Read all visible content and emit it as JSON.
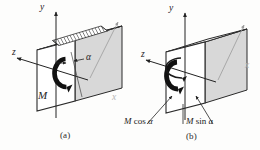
{
  "figure": {
    "background_color": "#fdfdfc",
    "ink_color": "#232323",
    "face_fill": "#d8d8d8",
    "top_face_fill": "#fbfbfb",
    "front_face_fill": "#ffffff"
  },
  "panels": [
    {
      "id": "a",
      "caption": "(a)",
      "axes": [
        {
          "name": "y",
          "label": "y"
        },
        {
          "name": "z",
          "label": "z"
        },
        {
          "name": "x",
          "label": "x"
        }
      ],
      "labels": {
        "moment": "M",
        "angle": "α"
      },
      "annotations": [
        {
          "name": "hatched-band",
          "label": ""
        },
        {
          "name": "moment-arc",
          "label": "M"
        },
        {
          "name": "angle-dimension",
          "label": "α"
        }
      ]
    },
    {
      "id": "b",
      "caption": "(b)",
      "axes": [
        {
          "name": "y",
          "label": "y"
        },
        {
          "name": "z",
          "label": "z"
        },
        {
          "name": "x",
          "label": "x"
        }
      ],
      "labels": {
        "moment_cos": {
          "sym": "M",
          "fn": "cos",
          "arg": "α"
        },
        "moment_sin": {
          "sym": "M",
          "fn": "sin",
          "arg": "a"
        }
      },
      "annotations": [
        {
          "name": "moment-cos-arc",
          "label": "M cos α"
        },
        {
          "name": "moment-sin-arc",
          "label": "M sin a"
        }
      ]
    }
  ],
  "text": {
    "caption_a": "(a)",
    "caption_b": "(b)",
    "y_a": "y",
    "z_a": "z",
    "x_a": "x",
    "alpha_a": "α",
    "M_a": "M",
    "y_b": "y",
    "z_b": "z",
    "x_b": "x",
    "M_cos_sym": "M",
    "M_cos_fn": "cos",
    "M_cos_arg": "α",
    "M_sin_sym": "M",
    "M_sin_fn": "sin",
    "M_sin_arg": "a"
  }
}
